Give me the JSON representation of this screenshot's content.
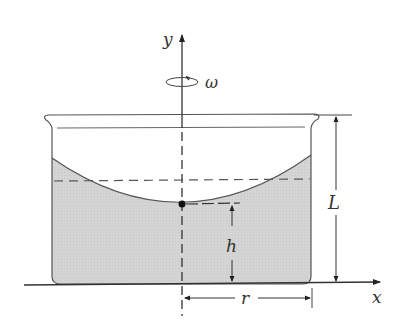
{
  "diagram": {
    "labels": {
      "y_axis": "y",
      "x_axis": "x",
      "angular_velocity": "ω",
      "container_height": "L",
      "vertex_height": "h",
      "radius": "r"
    },
    "colors": {
      "fluid": "#d3d3d3",
      "stroke": "#444444",
      "background": "#ffffff"
    }
  }
}
